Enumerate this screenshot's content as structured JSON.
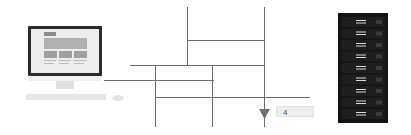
{
  "diagram": {
    "left_device": "desktop-computer",
    "right_device": "server-rack",
    "label_value": "4",
    "colors": {
      "line": "#6e6e6e",
      "monitor_frame": "#2b2b2b",
      "screen_bg": "#eaeaea",
      "screen_block": "#a8a8a8",
      "rack_body": "#141414",
      "rack_slot_light": "#d8d8d8",
      "label_bg": "#eeeeee"
    },
    "rack_units": 9
  }
}
